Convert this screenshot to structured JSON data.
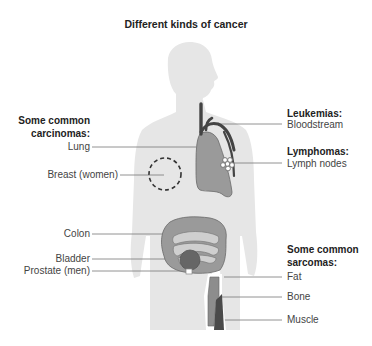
{
  "title": "Different kinds of cancer",
  "colors": {
    "silhouette": "#e6e6e6",
    "organ": "#9a9a9a",
    "organ_dark": "#555555",
    "organ_light": "#c8c8c8",
    "leader_line": "#666666",
    "text": "#444444"
  },
  "left_group": {
    "heading_line1": "Some common",
    "heading_line2": "carcinomas:",
    "items": [
      {
        "label": "Lung"
      },
      {
        "label": "Breast (women)"
      },
      {
        "label": "Colon"
      },
      {
        "label": "Bladder"
      },
      {
        "label": "Prostate (men)"
      }
    ]
  },
  "right_groups": {
    "leukemias": {
      "heading": "Leukemias:",
      "item": "Bloodstream"
    },
    "lymphomas": {
      "heading": "Lymphomas:",
      "item": "Lymph nodes"
    },
    "sarcomas": {
      "heading_line1": "Some common",
      "heading_line2": "sarcomas:",
      "items": [
        {
          "label": "Fat"
        },
        {
          "label": "Bone"
        },
        {
          "label": "Muscle"
        }
      ]
    }
  }
}
